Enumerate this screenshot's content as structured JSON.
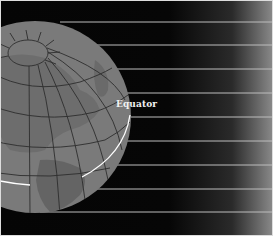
{
  "diagram": {
    "labels": {
      "equator": "Equator"
    },
    "colors": {
      "background": "#050505",
      "globe": "#7c7c7c",
      "land": "#6e6e6e",
      "grid": "#2e2e2e",
      "rays": "#bdbdbd",
      "equator_line": "#ffffff"
    },
    "rays": {
      "count": 9,
      "y_positions": [
        22,
        45,
        69,
        93,
        117,
        141,
        165,
        189,
        212
      ]
    }
  }
}
